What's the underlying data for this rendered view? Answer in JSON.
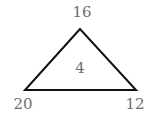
{
  "diagram": {
    "type": "triangle-puzzle",
    "vertices": {
      "top": "16",
      "bottom_left": "20",
      "bottom_right": "12"
    },
    "center": "4",
    "colors": {
      "stroke": "#111111",
      "text": "#6e6e6e"
    }
  }
}
